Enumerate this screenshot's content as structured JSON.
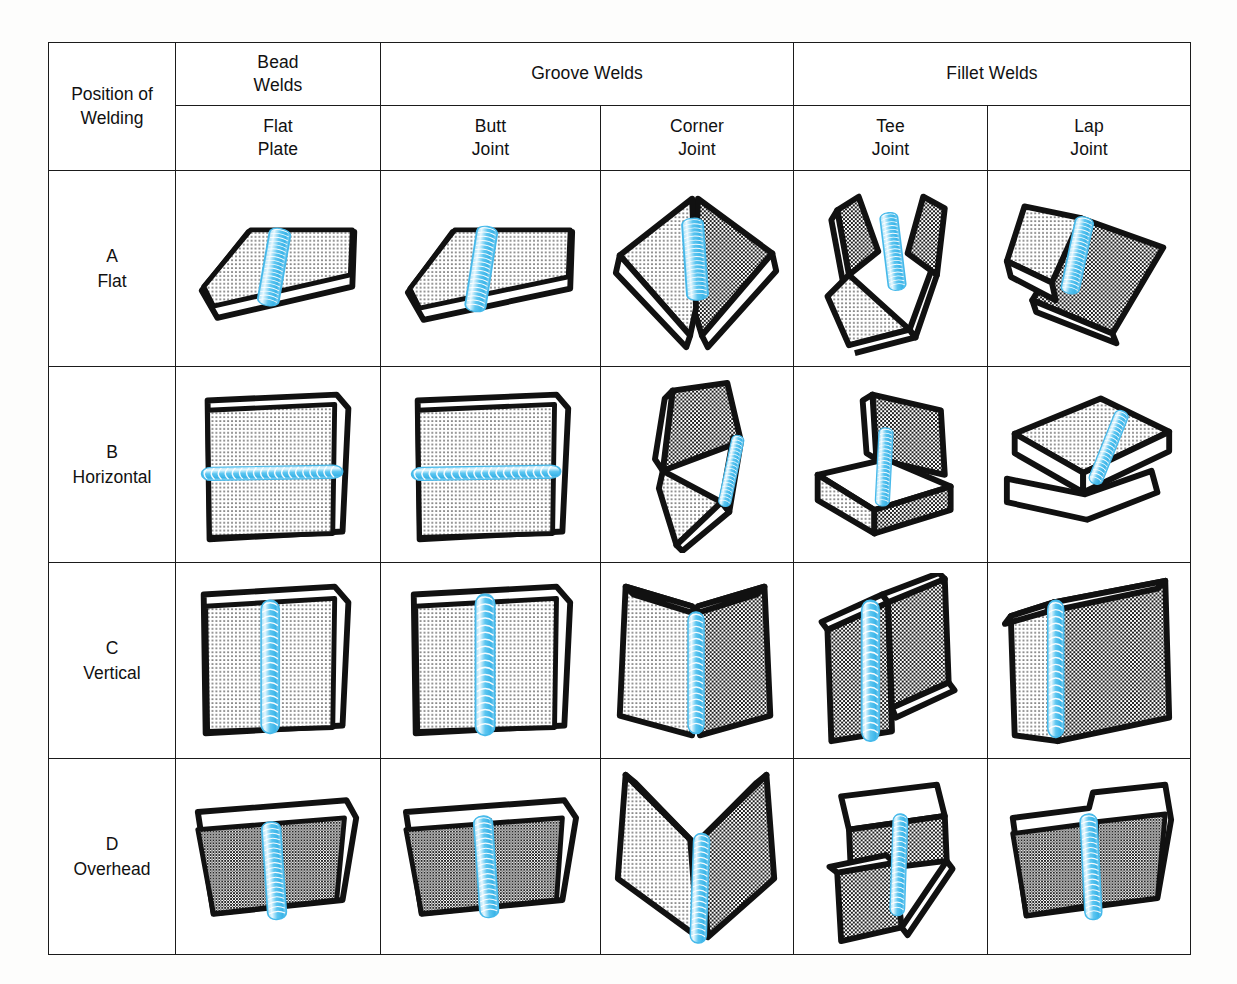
{
  "table": {
    "corner_label": "Position of\nWelding",
    "corner_label_line1": "Position of",
    "corner_label_line2": "Welding",
    "group_headers": [
      {
        "label": "Bead\nWelds",
        "line1": "Bead",
        "line2": "Welds",
        "span": 1
      },
      {
        "label": "Groove Welds",
        "line1": "Groove Welds",
        "line2": "",
        "span": 2
      },
      {
        "label": "Fillet Welds",
        "line1": "Fillet Welds",
        "line2": "",
        "span": 2
      }
    ],
    "column_headers": [
      {
        "line1": "Flat",
        "line2": "Plate",
        "key": "flat-plate"
      },
      {
        "line1": "Butt",
        "line2": "Joint",
        "key": "butt-joint"
      },
      {
        "line1": "Corner",
        "line2": "Joint",
        "key": "corner-joint"
      },
      {
        "line1": "Tee",
        "line2": "Joint",
        "key": "tee-joint"
      },
      {
        "line1": "Lap",
        "line2": "Joint",
        "key": "lap-joint"
      }
    ],
    "rows": [
      {
        "letter": "A",
        "name": "Flat",
        "key": "flat"
      },
      {
        "letter": "B",
        "name": "Horizontal",
        "key": "horizontal"
      },
      {
        "letter": "C",
        "name": "Vertical",
        "key": "vertical"
      },
      {
        "letter": "D",
        "name": "Overhead",
        "key": "overhead"
      }
    ],
    "cells": [
      [
        {
          "illustration": "flat-plate-bead-weld-flat-position"
        },
        {
          "illustration": "butt-joint-groove-weld-flat-position"
        },
        {
          "illustration": "corner-joint-groove-weld-flat-position"
        },
        {
          "illustration": "tee-joint-fillet-weld-flat-position"
        },
        {
          "illustration": "lap-joint-fillet-weld-flat-position"
        }
      ],
      [
        {
          "illustration": "flat-plate-bead-weld-horizontal-position"
        },
        {
          "illustration": "butt-joint-groove-weld-horizontal-position"
        },
        {
          "illustration": "corner-joint-groove-weld-horizontal-position"
        },
        {
          "illustration": "tee-joint-fillet-weld-horizontal-position"
        },
        {
          "illustration": "lap-joint-fillet-weld-horizontal-position"
        }
      ],
      [
        {
          "illustration": "flat-plate-bead-weld-vertical-position"
        },
        {
          "illustration": "butt-joint-groove-weld-vertical-position"
        },
        {
          "illustration": "corner-joint-groove-weld-vertical-position"
        },
        {
          "illustration": "tee-joint-fillet-weld-vertical-position"
        },
        {
          "illustration": "lap-joint-fillet-weld-vertical-position"
        }
      ],
      [
        {
          "illustration": "flat-plate-bead-weld-overhead-position"
        },
        {
          "illustration": "butt-joint-groove-weld-overhead-position"
        },
        {
          "illustration": "corner-joint-groove-weld-overhead-position"
        },
        {
          "illustration": "tee-joint-fillet-weld-overhead-position"
        },
        {
          "illustration": "lap-joint-fillet-weld-overhead-position"
        }
      ]
    ]
  },
  "colors": {
    "page_background": "#fdfdfc",
    "cell_background": "#ffffff",
    "border": "#1b1b1b",
    "text": "#111111",
    "weld_bead": "#4fc3f0",
    "weld_bead_light": "#bfe9fb",
    "weld_bead_highlight": "#ffffff",
    "metal_outline": "#111111",
    "hatch_light": "#f2f2f2",
    "hatch_dark": "#8a8a8a",
    "plate_face_white": "#ffffff"
  }
}
